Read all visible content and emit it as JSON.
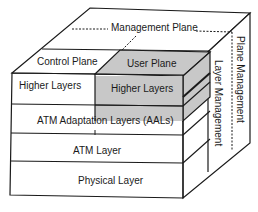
{
  "diagram": {
    "labels": {
      "management_plane": "Management Plane",
      "control_plane": "Control Plane",
      "user_plane": "User Plane",
      "higher_layers_control": "Higher Layers",
      "higher_layers_user": "Higher Layers",
      "aal": "ATM Adaptation Layers (AALs)",
      "atm_layer": "ATM Layer",
      "physical_layer": "Physical Layer",
      "plane_management": "Plane Management",
      "layer_management": "Layer Management"
    },
    "colors": {
      "line": "#1a1a1a",
      "user_plane_fill": "#c8c8c8",
      "background": "#ffffff"
    }
  }
}
